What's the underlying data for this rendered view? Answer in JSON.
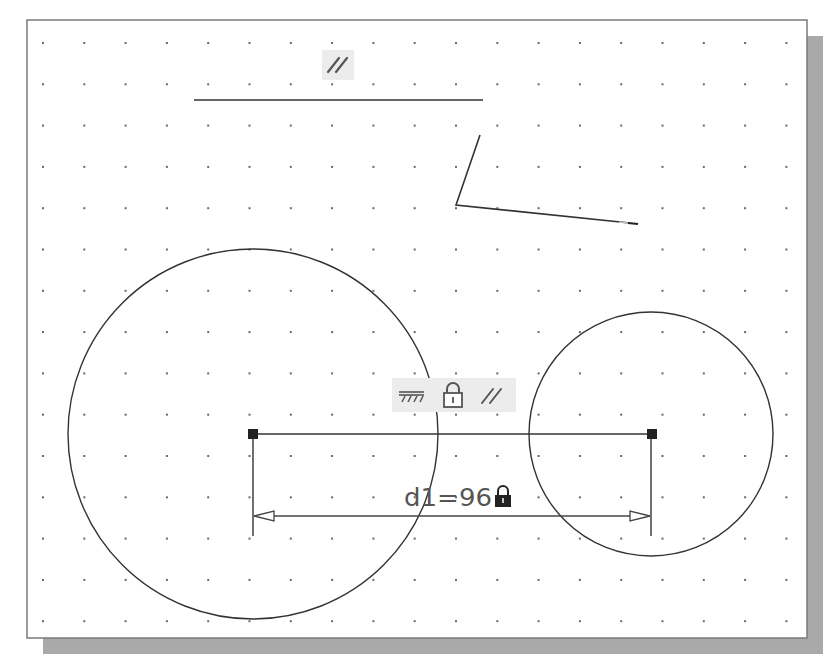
{
  "drawing": {
    "frame": {
      "x": 27,
      "y": 20,
      "width": 780,
      "height": 618,
      "shadow_offset": 16,
      "border_color": "#7a7a7a",
      "shadow_color": "#a9a9a9"
    },
    "grid": {
      "origin_x": 43,
      "origin_y": 43,
      "spacing": 41.3,
      "dot_color": "#6a6a6a"
    },
    "line_color": "#333333",
    "constraint_bg": "#ececec",
    "top_line": {
      "x1": 194,
      "y1": 100,
      "x2": 483,
      "y2": 100
    },
    "top_parallel_symbol": {
      "label": "parallel-constraint",
      "glyph": "//",
      "x": 322,
      "y": 50,
      "w": 32,
      "h": 30
    },
    "polyline": {
      "points": "480,135 456,205 630,223",
      "tail_highlight": "620,222 638,224"
    },
    "circle_left": {
      "cx": 253,
      "cy": 434,
      "r": 185
    },
    "circle_right": {
      "cx": 651,
      "cy": 434,
      "r": 122
    },
    "center_line": {
      "x1": 253,
      "y1": 434,
      "x2": 652,
      "y2": 434
    },
    "constraints_row": {
      "box": {
        "x": 392,
        "y": 378,
        "w": 124,
        "h": 34
      },
      "items": [
        {
          "name": "ground-icon",
          "label": "ground-constraint"
        },
        {
          "name": "lock-icon",
          "label": "fixed-constraint"
        },
        {
          "name": "parallel-icon",
          "label": "parallel-constraint"
        }
      ]
    },
    "dimension": {
      "label": "d1=96",
      "locked": true,
      "line_y": 516,
      "x1": 253,
      "x2": 651,
      "ext_top": 434,
      "ext_bottom": 536
    }
  }
}
